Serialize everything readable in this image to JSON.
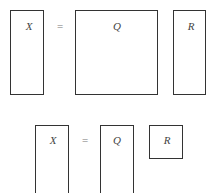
{
  "diagram": {
    "type": "QR decomposition illustration",
    "full": {
      "left": "X",
      "equals": "=",
      "q": "Q",
      "r": "R"
    },
    "reduced": {
      "left": "X",
      "equals": "=",
      "q": "Q",
      "r": "R"
    }
  }
}
